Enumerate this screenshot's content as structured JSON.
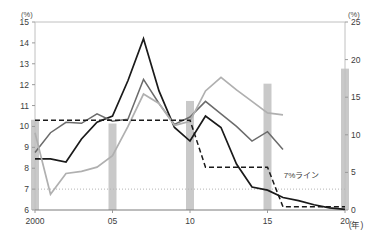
{
  "chart_data": {
    "type": "line",
    "title": "",
    "xlabel": "(年)",
    "ylabel": "(%)",
    "y2label": "(%)",
    "x": [
      2000,
      2001,
      2002,
      2003,
      2004,
      2005,
      2006,
      2007,
      2008,
      2009,
      2010,
      2011,
      2012,
      2013,
      2014,
      2015,
      2016,
      2017,
      2018,
      2019,
      2020
    ],
    "xtick_values": [
      2000,
      2005,
      2010,
      2015,
      2020
    ],
    "xtick_labels": [
      "2000",
      "05",
      "10",
      "15",
      "20"
    ],
    "ylim": [
      6,
      15
    ],
    "ytick_labels": [
      "6",
      "7",
      "8",
      "9",
      "10",
      "11",
      "12",
      "13",
      "14",
      "15"
    ],
    "ytick_values": [
      6,
      7,
      8,
      9,
      10,
      11,
      12,
      13,
      14,
      15
    ],
    "y2lim": [
      0,
      25
    ],
    "y2tick_labels": [
      "0",
      "5",
      "10",
      "15",
      "20",
      "25"
    ],
    "y2tick_values": [
      0,
      5,
      10,
      15,
      20,
      25
    ],
    "grid": false,
    "legend": "none",
    "annotations": [
      {
        "text": "7%ライン",
        "x": 2017.2,
        "y": 7.55,
        "kind": "threshold-label"
      }
    ],
    "reference_lines": [
      {
        "name": "seven-percent-line",
        "axis": "left",
        "value": 7,
        "style": "dotted",
        "color": "#b4b4b4"
      }
    ],
    "series": [
      {
        "name": "series-black-solid",
        "axis": "left",
        "color": "#1a1a1a",
        "style": "solid",
        "width": 1.7,
        "values": [
          8.45,
          8.45,
          8.3,
          9.4,
          10.2,
          10.5,
          12.2,
          14.2,
          11.7,
          9.95,
          9.3,
          10.5,
          9.95,
          8.2,
          7.1,
          6.95,
          6.6,
          6.45,
          6.25,
          6.1,
          6.03
        ]
      },
      {
        "name": "series-dark-gray",
        "axis": "left",
        "color": "#6b6b6b",
        "style": "solid",
        "width": 1.5,
        "values": [
          8.75,
          9.7,
          10.2,
          10.15,
          10.6,
          10.25,
          10.35,
          12.25,
          11.1,
          10.1,
          10.45,
          11.2,
          10.6,
          10.0,
          9.3,
          9.75,
          8.9,
          null,
          null,
          null,
          null
        ]
      },
      {
        "name": "series-light-gray",
        "axis": "left",
        "color": "#b0b0b0",
        "style": "solid",
        "width": 1.7,
        "values": [
          9.7,
          6.75,
          7.75,
          7.85,
          8.05,
          8.6,
          10.0,
          11.55,
          11.1,
          10.05,
          10.25,
          11.7,
          12.35,
          11.75,
          11.2,
          10.65,
          10.55,
          null,
          null,
          null,
          null
        ]
      },
      {
        "name": "series-black-dashed",
        "axis": "left",
        "color": "#1a1a1a",
        "style": "dashed",
        "width": 1.5,
        "values": [
          10.3,
          10.3,
          10.3,
          10.3,
          10.3,
          10.3,
          10.3,
          10.3,
          10.3,
          10.3,
          10.3,
          8.05,
          8.05,
          8.05,
          8.05,
          8.05,
          6.15,
          6.15,
          6.15,
          6.15,
          6.15
        ]
      }
    ],
    "bars": {
      "name": "gray-bars",
      "axis": "right",
      "color": "#c9c9c9",
      "width_px": 8,
      "points": [
        {
          "x": 2000,
          "value": 12.0
        },
        {
          "x": 2005,
          "value": 11.5
        },
        {
          "x": 2010,
          "value": 14.5
        },
        {
          "x": 2015,
          "value": 16.8
        },
        {
          "x": 2020,
          "value": 18.8
        }
      ]
    }
  },
  "axes": {
    "left_unit": "(%)",
    "right_unit": "(%)",
    "x_unit": "(年)"
  },
  "colors": {
    "plot_border": "#c0c0c0",
    "bar_fill": "#c9c9c9",
    "line_black": "#1a1a1a",
    "line_dark_gray": "#6b6b6b",
    "line_light_gray": "#b0b0b0",
    "reference_dotted": "#b4b4b4",
    "background": "#ffffff"
  }
}
